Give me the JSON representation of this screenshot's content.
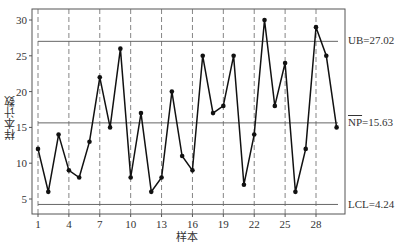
{
  "chart_data": {
    "type": "line",
    "title": "",
    "xlabel": "样本",
    "ylabel": "样本计数",
    "x": [
      1,
      2,
      3,
      4,
      5,
      6,
      7,
      8,
      9,
      10,
      11,
      12,
      13,
      14,
      15,
      16,
      17,
      18,
      19,
      20,
      21,
      22,
      23,
      24,
      25,
      26,
      27,
      28,
      29,
      30
    ],
    "series": [
      {
        "name": "样本计数",
        "values": [
          12,
          6,
          14,
          9,
          8,
          13,
          22,
          15,
          26,
          8,
          17,
          6,
          8,
          20,
          11,
          9,
          25,
          17,
          18,
          25,
          7,
          14,
          30,
          18,
          24,
          6,
          12,
          29,
          25,
          15
        ]
      }
    ],
    "x_ticks": [
      1,
      4,
      7,
      10,
      13,
      16,
      19,
      22,
      25,
      28
    ],
    "y_ticks": [
      5,
      10,
      15,
      20,
      25,
      30
    ],
    "xlim": [
      0.5,
      31
    ],
    "ylim": [
      2.9,
      31.5
    ],
    "grid": {
      "vertical_dashed_at": [
        1,
        4,
        7,
        10,
        13,
        16,
        19,
        22,
        25,
        28
      ],
      "horizontal": false
    },
    "control_limits": {
      "UCL": {
        "label": "UB=27.02",
        "value": 27.02
      },
      "CL": {
        "label_prefix": "NP",
        "label_suffix": "=15.63",
        "value": 15.63
      },
      "LCL": {
        "label": "LCL=4.24",
        "value": 4.24
      }
    },
    "legend": null
  },
  "labels": {
    "ucl": "UB=27.02",
    "cl_np": "NP",
    "cl_val": "=15.63",
    "lcl": "LCL=4.24",
    "xlabel": "样本",
    "ylabel": "样本计数"
  }
}
